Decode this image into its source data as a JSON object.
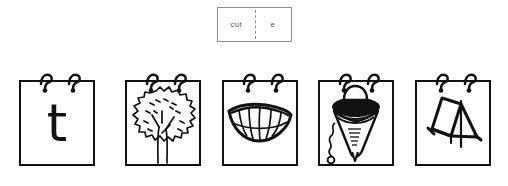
{
  "worksheet": {
    "title": "Letter T picture flip cards",
    "stroke_color": "#111111",
    "label_border_color": "#8d8d8d",
    "label_text_color": "#5a5a5a"
  },
  "cut_label": {
    "left_text": "cut",
    "right_text": "e",
    "divider_style": "dashed"
  },
  "cards": [
    {
      "name": "letter-t",
      "kind": "letter",
      "letter": "t",
      "alt": "lowercase letter t"
    },
    {
      "name": "tree",
      "kind": "picture",
      "letter": "",
      "alt": "tree"
    },
    {
      "name": "teeth",
      "kind": "picture",
      "letter": "",
      "alt": "teeth smile"
    },
    {
      "name": "top",
      "kind": "picture",
      "letter": "",
      "alt": "spinning top"
    },
    {
      "name": "tent",
      "kind": "picture",
      "letter": "",
      "alt": "tent"
    }
  ]
}
